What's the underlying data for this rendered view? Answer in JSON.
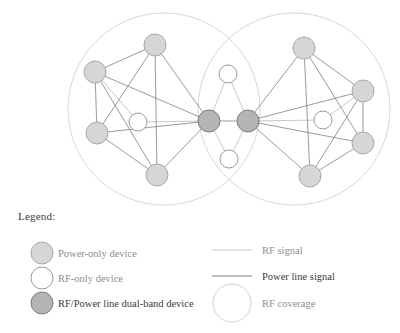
{
  "diagram": {
    "type": "network-topology",
    "canvas": {
      "width": 400,
      "height": 333
    },
    "colors": {
      "power_only_fill": "#d6d6d6",
      "power_only_stroke": "#a8a8a8",
      "rf_only_fill": "#ffffff",
      "rf_only_stroke": "#9a9a9a",
      "dual_band_fill": "#b4b4b4",
      "dual_band_stroke": "#7d7d7d",
      "rf_signal_line": "#c9c9c9",
      "power_line_signal": "#808080",
      "rf_coverage_circle": "#d2d2d2",
      "legend_text_dim": "#8e8e8e",
      "legend_text_dark": "#3a3a3a"
    },
    "coverage_circles": [
      {
        "name": "left-rf-coverage",
        "cx": 164,
        "cy": 109,
        "r": 96
      },
      {
        "name": "right-rf-coverage",
        "cx": 294,
        "cy": 109,
        "r": 96
      }
    ],
    "nodes": [
      {
        "id": "L1",
        "type": "power-only",
        "cx": 95,
        "cy": 72,
        "r": 11
      },
      {
        "id": "L2",
        "type": "power-only",
        "cx": 155,
        "cy": 45,
        "r": 11
      },
      {
        "id": "L3",
        "type": "power-only",
        "cx": 97,
        "cy": 133,
        "r": 11
      },
      {
        "id": "L4",
        "type": "power-only",
        "cx": 157,
        "cy": 175,
        "r": 11
      },
      {
        "id": "L5",
        "type": "rf-only",
        "cx": 138,
        "cy": 122,
        "r": 9
      },
      {
        "id": "C1",
        "type": "dual-band",
        "cx": 209,
        "cy": 121,
        "r": 11
      },
      {
        "id": "C2",
        "type": "dual-band",
        "cx": 248,
        "cy": 121,
        "r": 11
      },
      {
        "id": "CT",
        "type": "rf-only",
        "cx": 228,
        "cy": 74,
        "r": 9
      },
      {
        "id": "CB",
        "type": "rf-only",
        "cx": 229,
        "cy": 159,
        "r": 9
      },
      {
        "id": "R1",
        "type": "power-only",
        "cx": 304,
        "cy": 48,
        "r": 11
      },
      {
        "id": "R2",
        "type": "power-only",
        "cx": 363,
        "cy": 91,
        "r": 11
      },
      {
        "id": "R3",
        "type": "power-only",
        "cx": 363,
        "cy": 143,
        "r": 11
      },
      {
        "id": "R4",
        "type": "power-only",
        "cx": 310,
        "cy": 176,
        "r": 11
      },
      {
        "id": "R5",
        "type": "rf-only",
        "cx": 323,
        "cy": 120,
        "r": 9
      }
    ],
    "edges": [
      {
        "from": "L1",
        "to": "L2",
        "signal": "power"
      },
      {
        "from": "L1",
        "to": "L3",
        "signal": "power"
      },
      {
        "from": "L1",
        "to": "L4",
        "signal": "power"
      },
      {
        "from": "L1",
        "to": "C1",
        "signal": "power"
      },
      {
        "from": "L2",
        "to": "L3",
        "signal": "power"
      },
      {
        "from": "L2",
        "to": "L4",
        "signal": "power"
      },
      {
        "from": "L2",
        "to": "C1",
        "signal": "power"
      },
      {
        "from": "L3",
        "to": "L4",
        "signal": "power"
      },
      {
        "from": "L3",
        "to": "C1",
        "signal": "power"
      },
      {
        "from": "L4",
        "to": "C1",
        "signal": "power"
      },
      {
        "from": "L5",
        "to": "C1",
        "signal": "rf"
      },
      {
        "from": "L1",
        "to": "L5",
        "signal": "rf"
      },
      {
        "from": "C1",
        "to": "CT",
        "signal": "rf"
      },
      {
        "from": "C1",
        "to": "CB",
        "signal": "rf"
      },
      {
        "from": "C2",
        "to": "CT",
        "signal": "rf"
      },
      {
        "from": "C2",
        "to": "CB",
        "signal": "rf"
      },
      {
        "from": "C1",
        "to": "C2",
        "signal": "power"
      },
      {
        "from": "R1",
        "to": "R2",
        "signal": "power"
      },
      {
        "from": "R1",
        "to": "R3",
        "signal": "power"
      },
      {
        "from": "R1",
        "to": "R4",
        "signal": "power"
      },
      {
        "from": "R1",
        "to": "C2",
        "signal": "power"
      },
      {
        "from": "R2",
        "to": "R3",
        "signal": "power"
      },
      {
        "from": "R2",
        "to": "R4",
        "signal": "power"
      },
      {
        "from": "R2",
        "to": "C2",
        "signal": "power"
      },
      {
        "from": "R3",
        "to": "R4",
        "signal": "power"
      },
      {
        "from": "R3",
        "to": "C2",
        "signal": "power"
      },
      {
        "from": "R4",
        "to": "C2",
        "signal": "power"
      },
      {
        "from": "R5",
        "to": "C2",
        "signal": "rf"
      },
      {
        "from": "R2",
        "to": "R5",
        "signal": "rf"
      }
    ]
  },
  "legend": {
    "title": "Legend:",
    "left_column": [
      {
        "swatch": "power-only-swatch",
        "label": "Power-only device"
      },
      {
        "swatch": "rf-only-swatch",
        "label": "RF-only device"
      },
      {
        "swatch": "dual-band-swatch",
        "label": "RF/Power line dual-band device"
      }
    ],
    "right_column": [
      {
        "swatch": "rf-signal-line-swatch",
        "label": "RF signal"
      },
      {
        "swatch": "power-line-signal-swatch",
        "label": "Power line signal"
      },
      {
        "swatch": "rf-coverage-circle-swatch",
        "label": "RF coverage"
      }
    ]
  }
}
